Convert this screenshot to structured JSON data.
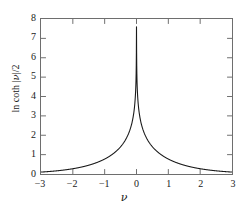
{
  "figure": {
    "background_color": "#ffffff",
    "frame_color": "#6e6e6e",
    "curve_color": "#1a1a1a"
  },
  "chart_data": {
    "type": "line",
    "title": "",
    "subtitle": "",
    "xlabel": "ν",
    "ylabel_parts": {
      "prefix": "ln coth |",
      "variable": "ν",
      "suffix": "|/2"
    },
    "ylabel": "ln coth |ν|/2",
    "xlim": [
      -3,
      3
    ],
    "ylim": [
      0,
      8
    ],
    "xticks": [
      -3,
      -2,
      -1,
      0,
      1,
      2,
      3
    ],
    "xtick_labels": [
      "−3",
      "−2",
      "−1",
      "0",
      "1",
      "2",
      "3"
    ],
    "yticks": [
      0,
      1,
      2,
      3,
      4,
      5,
      6,
      7,
      8
    ],
    "ytick_labels": [
      "0",
      "1",
      "2",
      "3",
      "4",
      "5",
      "6",
      "7",
      "8"
    ],
    "tick_direction": "in",
    "grid": false,
    "legend": null,
    "annotations": [],
    "series": [
      {
        "name": "ln coth |ν|/2",
        "formula": "y = ln(coth(|x|/2))",
        "peak": {
          "x": 0,
          "y": 7.6
        },
        "x": [
          -3.0,
          -2.8,
          -2.6,
          -2.4,
          -2.2,
          -2.0,
          -1.8,
          -1.6,
          -1.4,
          -1.2,
          -1.0,
          -0.9,
          -0.8,
          -0.7,
          -0.6,
          -0.5,
          -0.4,
          -0.3,
          -0.2,
          -0.15,
          -0.1,
          -0.05,
          -0.02,
          -0.001,
          0.001,
          0.02,
          0.05,
          0.1,
          0.15,
          0.2,
          0.3,
          0.4,
          0.5,
          0.6,
          0.7,
          0.8,
          0.9,
          1.0,
          1.2,
          1.4,
          1.6,
          1.8,
          2.0,
          2.2,
          2.4,
          2.6,
          2.8,
          3.0
        ],
        "y": [
          0.1,
          0.12,
          0.15,
          0.18,
          0.22,
          0.27,
          0.33,
          0.41,
          0.52,
          0.66,
          0.85,
          0.97,
          1.11,
          1.27,
          1.47,
          1.71,
          2.0,
          2.37,
          2.84,
          3.13,
          3.52,
          4.21,
          4.61,
          7.6,
          7.6,
          4.61,
          4.21,
          3.52,
          3.13,
          2.84,
          2.37,
          2.0,
          1.71,
          1.47,
          1.27,
          1.11,
          0.97,
          0.85,
          0.66,
          0.52,
          0.41,
          0.33,
          0.27,
          0.22,
          0.18,
          0.15,
          0.12,
          0.1
        ]
      }
    ]
  }
}
